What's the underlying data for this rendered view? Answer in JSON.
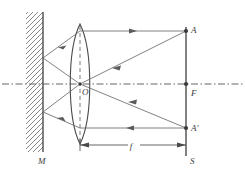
{
  "figure": {
    "kind": "optics-ray-diagram",
    "width": 246,
    "height": 169,
    "background": "#ffffff",
    "stroke_color": "#4a4a4a",
    "axis_color": "#555555",
    "label_color": "#3a3a3a"
  },
  "labels": {
    "mirror": "M",
    "lens_center": "O",
    "object_top": "A",
    "focal_point": "F",
    "image_point": "A'",
    "screen": "S",
    "focal_length": "f"
  },
  "components": {
    "mirror": {
      "name": "plane-mirror",
      "x": 43,
      "y_top": 12,
      "y_bottom": 152,
      "hatch_direction": "backslash",
      "hatch_width": 17
    },
    "lens": {
      "name": "converging-lens",
      "center_x": 80,
      "center_y": 84,
      "half_height": 61,
      "bulge": 13
    },
    "screen": {
      "name": "screen-line",
      "x": 186,
      "y_top": 27,
      "y_bottom": 155
    },
    "optical_axis": {
      "name": "optical-axis",
      "y": 84,
      "x_start": 2,
      "x_end": 244,
      "style": "dash-dot"
    },
    "lens_axis": {
      "name": "lens-vertical-axis",
      "x": 80,
      "y_top": 25,
      "y_bottom": 145,
      "style": "dashed"
    }
  },
  "points": [
    {
      "name": "point-A",
      "x": 186,
      "y": 31,
      "label": "A",
      "label_dx": 4,
      "label_dy": -1
    },
    {
      "name": "point-F",
      "x": 186,
      "y": 84,
      "label": "F",
      "label_dx": 4,
      "label_dy": 11
    },
    {
      "name": "point-A-prime",
      "x": 186,
      "y": 128,
      "label": "A'",
      "label_dx": 4,
      "label_dy": 2
    },
    {
      "name": "point-S",
      "x": 186,
      "y": 155,
      "label": "S",
      "label_dx": 4,
      "label_dy": 7
    },
    {
      "name": "point-O",
      "x": 80,
      "y": 84,
      "label": "O",
      "label_dx": 2,
      "label_dy": 11
    },
    {
      "name": "point-M",
      "x": 43,
      "y": 152,
      "label": "M",
      "label_dx": -3,
      "label_dy": 12
    }
  ],
  "rays": [
    {
      "name": "ray-A-to-lens-horizontal",
      "x1": 186,
      "y1": 31,
      "x2": 80,
      "y2": 31,
      "arrow_at": 0.47,
      "arrow_dir": "left"
    },
    {
      "name": "ray-lens-to-mirror-upper",
      "x1": 80,
      "y1": 31,
      "x2": 43,
      "y2": 58,
      "arrow_at": 0.55,
      "arrow_dir": "left"
    },
    {
      "name": "ray-mirror-to-lens-center",
      "x1": 43,
      "y1": 58,
      "x2": 80,
      "y2": 84,
      "arrow_at": 0.0,
      "arrow_dir": "none"
    },
    {
      "name": "ray-A-through-center",
      "x1": 186,
      "y1": 31,
      "x2": 80,
      "y2": 84,
      "arrow_at": 0.52,
      "arrow_dir": "left"
    },
    {
      "name": "ray-center-to-mirror-lower",
      "x1": 80,
      "y1": 84,
      "x2": 43,
      "y2": 112,
      "arrow_at": 0.0,
      "arrow_dir": "none"
    },
    {
      "name": "ray-mirror-lower-to-lens-bottom",
      "x1": 43,
      "y1": 112,
      "x2": 80,
      "y2": 128,
      "arrow_at": 0.5,
      "arrow_dir": "left-down"
    },
    {
      "name": "ray-lens-bottom-to-Aprime",
      "x1": 80,
      "y1": 128,
      "x2": 186,
      "y2": 128,
      "arrow_at": 0.5,
      "arrow_dir": "right"
    },
    {
      "name": "ray-Aprime-through-center-upper",
      "x1": 186,
      "y1": 128,
      "x2": 80,
      "y2": 84,
      "arrow_at": 0.45,
      "arrow_dir": "left"
    }
  ],
  "dimension": {
    "name": "focal-length-dimension",
    "label": "f",
    "y": 145,
    "x1": 80,
    "x2": 186,
    "label_x": 133,
    "label_y": 143
  }
}
